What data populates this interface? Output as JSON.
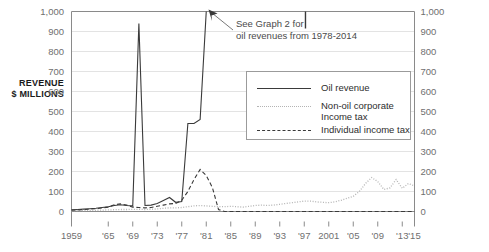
{
  "axis_title": {
    "line1": "REVENUE",
    "line2": "$ MILLIONS"
  },
  "annotation": {
    "line1": "See Graph 2 for",
    "line2": "oil revenues from 1978-2014"
  },
  "legend": {
    "items": [
      {
        "label": "Oil revenue",
        "label2": "",
        "style": "solid"
      },
      {
        "label": "Non-oil corporate",
        "label2": "Income tax",
        "style": "dotted"
      },
      {
        "label": "Individual income tax",
        "label2": "",
        "style": "dashed"
      }
    ]
  },
  "y_ticks_left": [
    "1,000",
    "900",
    "800",
    "700",
    "600",
    "500",
    "400",
    "300",
    "200",
    "100",
    "0"
  ],
  "y_ticks_right": [
    "1,000",
    "900",
    "800",
    "700",
    "600",
    "500",
    "400",
    "300",
    "200",
    "100",
    "0"
  ],
  "x_ticks": [
    "1959",
    "'65",
    "'69",
    "'73",
    "'77",
    "'81",
    "'85",
    "'89",
    "'93",
    "'97",
    "2001",
    "'05",
    "'09",
    "'13",
    "'15"
  ],
  "colors": {
    "oil": "#3a3a3a",
    "corporate": "#b4b4b4",
    "individual": "#3a3a3a",
    "grid": "#e3e3e3",
    "axis": "#8a8a8a",
    "tick_text": "#6f6f6f",
    "annotation_text": "#4a4a4a"
  },
  "chart_data": {
    "type": "line",
    "title": "",
    "xlabel": "",
    "ylabel": "REVENUE $ MILLIONS",
    "xlim": [
      1959,
      2015
    ],
    "ylim": [
      0,
      1000
    ],
    "grid": true,
    "legend_position": "inside-upper-right",
    "annotations": [
      {
        "text": "See Graph 2 for oil revenues from 1978-2014",
        "points_to_year": 1978,
        "points_to_value": 1000
      }
    ],
    "x": [
      1959,
      1960,
      1961,
      1962,
      1963,
      1964,
      1965,
      1966,
      1967,
      1968,
      1969,
      1970,
      1971,
      1972,
      1973,
      1974,
      1975,
      1976,
      1977,
      1978,
      1979,
      1980,
      1981,
      1982,
      1983,
      1984,
      1985,
      1986,
      1987,
      1988,
      1989,
      1990,
      1991,
      1992,
      1993,
      1994,
      1995,
      1996,
      1997,
      1998,
      1999,
      2000,
      2001,
      2002,
      2003,
      2004,
      2005,
      2006,
      2007,
      2008,
      2009,
      2010,
      2011,
      2012,
      2013,
      2014,
      2015
    ],
    "series": [
      {
        "name": "Oil revenue",
        "style": "solid",
        "values": [
          8,
          10,
          12,
          14,
          16,
          20,
          24,
          30,
          34,
          30,
          28,
          940,
          30,
          32,
          40,
          55,
          70,
          46,
          50,
          440,
          440,
          460,
          1000,
          null,
          null,
          null,
          null,
          null,
          null,
          null,
          null,
          null,
          null,
          null,
          null,
          null,
          null,
          null,
          1000,
          null,
          null,
          null,
          null,
          null,
          null,
          null,
          null,
          null,
          null,
          null,
          null,
          null,
          null,
          null,
          null,
          null,
          null
        ],
        "note": "Values from 1978-2014 exceed the axis; see Graph 2"
      },
      {
        "name": "Non-oil corporate Income tax",
        "style": "dotted",
        "values": [
          4,
          5,
          5,
          6,
          6,
          7,
          8,
          9,
          10,
          10,
          11,
          11,
          10,
          11,
          13,
          16,
          18,
          18,
          20,
          24,
          28,
          30,
          28,
          26,
          24,
          24,
          26,
          24,
          22,
          26,
          30,
          32,
          30,
          32,
          36,
          40,
          44,
          48,
          52,
          52,
          48,
          46,
          44,
          48,
          56,
          66,
          76,
          100,
          140,
          170,
          150,
          110,
          118,
          160,
          116,
          140,
          128
        ]
      },
      {
        "name": "Individual income tax",
        "style": "dashed",
        "values": [
          6,
          8,
          10,
          12,
          14,
          18,
          22,
          34,
          38,
          32,
          22,
          20,
          18,
          20,
          26,
          32,
          38,
          40,
          56,
          100,
          160,
          210,
          180,
          120,
          10,
          0,
          0,
          0,
          0,
          0,
          0,
          0,
          0,
          0,
          0,
          0,
          0,
          0,
          0,
          0,
          0,
          0,
          0,
          0,
          0,
          0,
          0,
          0,
          0,
          0,
          0,
          0,
          0,
          0,
          0,
          0,
          0
        ]
      }
    ]
  }
}
